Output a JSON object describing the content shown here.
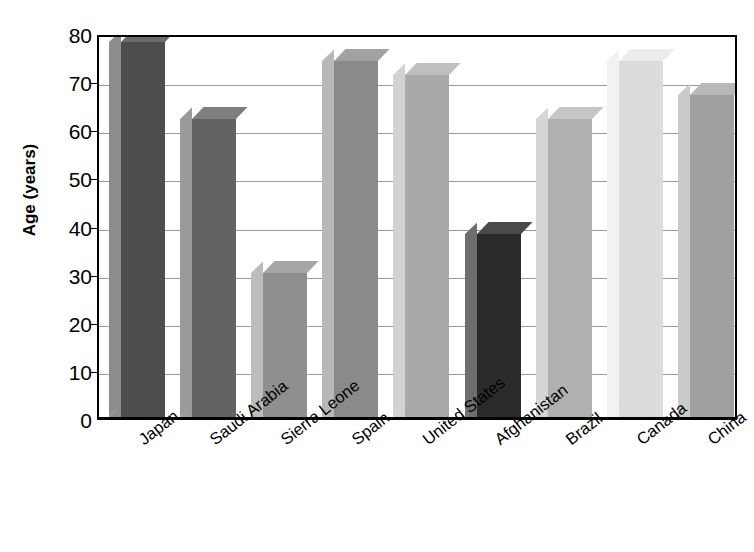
{
  "chart_data": {
    "type": "bar",
    "title": "",
    "xlabel": "",
    "ylabel": "Age (years)",
    "ylim": [
      0,
      80
    ],
    "yticks": [
      0,
      10,
      20,
      30,
      40,
      50,
      60,
      70,
      80
    ],
    "ytick_labels": [
      "0",
      "10",
      "20",
      "30",
      "40",
      "50",
      "60",
      "70",
      "80"
    ],
    "grid": true,
    "legend": "none",
    "style": "3d-bars-grayscale",
    "categories": [
      "Japan",
      "Saudi Arabia",
      "Sierra Leone",
      "Spain",
      "United States",
      "Afghanistan",
      "Brazil",
      "Canada",
      "China"
    ],
    "values": [
      78,
      62,
      30,
      74,
      71,
      38,
      62,
      74,
      67
    ],
    "bar_colors": [
      "#4d4d4d",
      "#636363",
      "#8f8f8f",
      "#8a8a8a",
      "#a9a9a9",
      "#2b2b2b",
      "#b0b0b0",
      "#dcdcdc",
      "#a0a0a0"
    ],
    "bar_top_colors": [
      "#6b6b6b",
      "#7e7e7e",
      "#a6a6a6",
      "#a2a2a2",
      "#c0c0c0",
      "#4a4a4a",
      "#c6c6c6",
      "#ececec",
      "#b8b8b8"
    ],
    "bar_side_colors": [
      "#8d8d8d",
      "#9a9a9a",
      "#bcbcbc",
      "#b8b8b8",
      "#d2d2d2",
      "#6e6e6e",
      "#d6d6d6",
      "#f2f2f2",
      "#cacaca"
    ],
    "axis_color": "#000000",
    "grid_color": "#9a9a9a",
    "background": "#ffffff"
  }
}
